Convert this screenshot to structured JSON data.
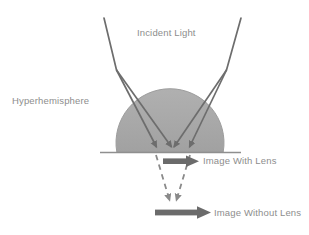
{
  "figure": {
    "type": "optics-ray-diagram",
    "background_color": "#ffffff",
    "title_text": "",
    "labels": {
      "incident_light": "Incident Light",
      "hyperhemisphere": "Hyperhemisphere",
      "image_with_lens": "Image With Lens",
      "image_without_lens": "Image Without Lens"
    },
    "colors": {
      "dome_fill": "#a9a9a9",
      "dome_stroke": "#9a9a9a",
      "ray_stroke": "#6d6d6d",
      "dashed_stroke": "#8a8a8a",
      "arrow_fill": "#6b6b6b",
      "label_text": "#8d8d8d",
      "baseline_stroke": "#8f8f8f"
    },
    "elements": {
      "dome": {
        "name": "hyperhemisphere-dome",
        "center_x": 170,
        "center_y": 104,
        "radius": 54,
        "flat_bottom_y": 152
      },
      "baseline": {
        "name": "flat-surface-line",
        "x1": 100,
        "x2": 241,
        "y": 152
      },
      "incident_rays": [
        {
          "name": "incident-ray-left",
          "x1": 104,
          "y1": 18,
          "x2": 116,
          "y2": 70
        },
        {
          "name": "incident-ray-right",
          "x1": 241,
          "y1": 18,
          "x2": 227,
          "y2": 70
        }
      ],
      "refracted_rays": [
        {
          "name": "refracted-ray-left-outer",
          "x1": 116,
          "y1": 70,
          "x2": 157,
          "y2": 150
        },
        {
          "name": "refracted-ray-left-inner",
          "x1": 116,
          "y1": 70,
          "x2": 172,
          "y2": 150
        },
        {
          "name": "refracted-ray-right-outer",
          "x1": 227,
          "y1": 70,
          "x2": 190,
          "y2": 150
        },
        {
          "name": "refracted-ray-right-inner",
          "x1": 227,
          "y1": 70,
          "x2": 173,
          "y2": 150
        }
      ],
      "dashed_rays": [
        {
          "name": "dashed-ray-left",
          "x1": 157,
          "y1": 154,
          "x2": 170,
          "y2": 203
        },
        {
          "name": "dashed-ray-right",
          "x1": 190,
          "y1": 154,
          "x2": 176,
          "y2": 203
        }
      ],
      "image_with_lens_arrow": {
        "name": "image-with-lens-arrow",
        "x": 163,
        "y": 157,
        "length": 35,
        "direction": "right"
      },
      "image_without_lens_arrow": {
        "name": "image-without-lens-arrow",
        "x": 155,
        "y": 212,
        "length": 56,
        "direction": "right"
      }
    }
  }
}
